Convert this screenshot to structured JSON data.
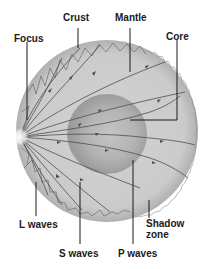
{
  "diagram": {
    "labels": {
      "focus": "Focus",
      "crust": "Crust",
      "mantle": "Mantle",
      "core": "Core",
      "shadow_zone_line1": "Shadow",
      "shadow_zone_line2": "zone",
      "l_waves": "L waves",
      "s_waves": "S waves",
      "p_waves": "P waves"
    },
    "colors": {
      "mantle": "#c8c8c8",
      "crust_edge": "#b4b4b4",
      "core": "#a8a8a8",
      "core_center": "#bdbdbd",
      "wave_lines": "#555555",
      "leader_lines": "#1a1a1a",
      "focus_glow": "#ffffff"
    }
  }
}
